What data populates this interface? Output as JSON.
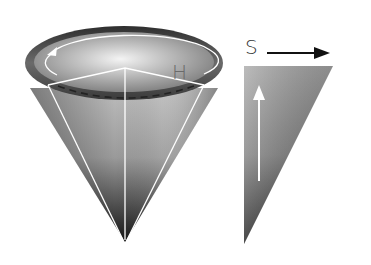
{
  "diagram": {
    "type": "hsv-color-model",
    "cone": {
      "hue_label": "H",
      "hue_direction": "counterclockwise"
    },
    "triangle": {
      "saturation_label": "S",
      "saturation_direction": "right",
      "value_direction": "up"
    },
    "colors": {
      "rim_dark": "#3a3a3a",
      "rim_light": "#9a9a9a",
      "top_light": "#e8e8e8",
      "body_mid": "#a8a8a8",
      "tip_dark": "#141414",
      "edge_line": "#ffffff",
      "arrow_black": "#111111"
    }
  }
}
